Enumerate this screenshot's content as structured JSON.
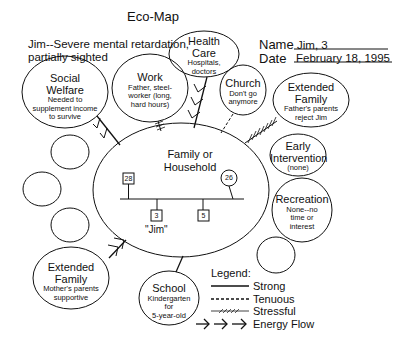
{
  "title": "Eco-Map",
  "client_description": [
    "Jim--Severe mental retardation,",
    "partially sighted"
  ],
  "meta": {
    "name_label": "Name",
    "name_value": "Jim, 3",
    "date_label": "Date",
    "date_value": "February 18, 1995"
  },
  "center": {
    "title_line1": "Family or",
    "title_line2": "Household",
    "members": [
      {
        "shape": "square",
        "label": "28"
      },
      {
        "shape": "circle",
        "label": "26"
      },
      {
        "shape": "square",
        "label": "3",
        "name": "\"Jim\""
      },
      {
        "shape": "square",
        "label": "5"
      }
    ]
  },
  "nodes": {
    "social_welfare": {
      "title1": "Social",
      "title2": "Welfare",
      "desc": [
        "Needed to",
        "supplement income",
        "to survive"
      ],
      "connection": "energy-flow"
    },
    "work": {
      "title1": "Work",
      "desc": [
        "Father, steel-",
        "worker (long,",
        "hard hours)"
      ],
      "connection": "stressful"
    },
    "health_care": {
      "title1": "Health",
      "title2": "Care",
      "desc": [
        "Hospitals,",
        "doctors"
      ],
      "connection": "energy-flow"
    },
    "church": {
      "title1": "Church",
      "desc": [
        "Don't go",
        "anymore"
      ],
      "connection": "tenuous"
    },
    "extended_family_father": {
      "title1": "Extended",
      "title2": "Family",
      "desc": [
        "Father's parents",
        "reject Jim"
      ],
      "connection": "stressful"
    },
    "early_intervention": {
      "title1": "Early",
      "title2": "Intervention",
      "desc": [
        "(none)"
      ],
      "connection": "none"
    },
    "recreation": {
      "title1": "Recreation",
      "desc": [
        "None--no",
        "time or",
        "interest"
      ],
      "connection": "none"
    },
    "school": {
      "title1": "School",
      "desc": [
        "Kindergarten",
        "for",
        "5-year-old"
      ],
      "connection": "strong"
    },
    "extended_family_mother": {
      "title1": "Extended",
      "title2": "Family",
      "desc": [
        "Mother's parents",
        "supportive"
      ],
      "connection": "energy-flow"
    }
  },
  "legend": {
    "title": "Legend:",
    "items": [
      {
        "style": "strong",
        "label": "Strong"
      },
      {
        "style": "tenuous",
        "label": "Tenuous"
      },
      {
        "style": "stressful",
        "label": "Stressful"
      },
      {
        "style": "energy-flow",
        "label": "Energy Flow"
      }
    ]
  }
}
